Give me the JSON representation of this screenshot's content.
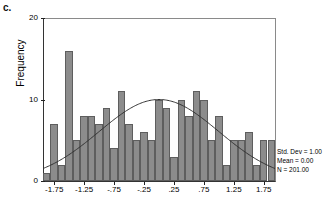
{
  "panel": {
    "label": "c."
  },
  "axes": {
    "y_label": "Frequency",
    "y_ticks": [
      "0",
      "10",
      "20"
    ],
    "x_ticks": [
      "-1.75",
      "-1.25",
      "-.75",
      "-.25",
      ".25",
      ".75",
      "1.25",
      "1.75"
    ]
  },
  "stats": {
    "std_dev": "Std. Dev = 1.00",
    "mean": "Mean = 0.00",
    "n": "N = 201.00"
  },
  "colors": {
    "bar_fill": "#8c8c8c",
    "bar_edge": "#5e5e5e",
    "curve": "#333333",
    "axis": "#222222",
    "frame": "#8a8a8a",
    "background": "#ffffff"
  },
  "chart_data": {
    "type": "bar",
    "title": "",
    "subtitle": "",
    "xlabel": "",
    "ylabel": "Frequency",
    "grid": false,
    "legend_position": "bottom-right",
    "xlim": [
      -1.9375,
      1.9375
    ],
    "ylim": [
      0,
      20
    ],
    "ytick_values": [
      0,
      10,
      20
    ],
    "xtick_values": [
      -1.75,
      -1.25,
      -0.75,
      -0.25,
      0.25,
      0.75,
      1.25,
      1.75
    ],
    "bin_width": 0.125,
    "bin_centers": [
      -1.875,
      -1.75,
      -1.625,
      -1.5,
      -1.375,
      -1.25,
      -1.125,
      -1.0,
      -0.875,
      -0.75,
      -0.625,
      -0.5,
      -0.375,
      -0.25,
      -0.125,
      0.0,
      0.125,
      0.25,
      0.375,
      0.5,
      0.625,
      0.75,
      0.875,
      1.0,
      1.125,
      1.25,
      1.375,
      1.5,
      1.625,
      1.75,
      1.875
    ],
    "categories": [
      "-1.875",
      "-1.75",
      "-1.625",
      "-1.5",
      "-1.375",
      "-1.25",
      "-1.125",
      "-1.0",
      "-0.875",
      "-0.75",
      "-0.625",
      "-0.5",
      "-0.375",
      "-0.25",
      "-0.125",
      "0.0",
      "0.125",
      "0.25",
      "0.375",
      "0.5",
      "0.625",
      "0.75",
      "0.875",
      "1.0",
      "1.125",
      "1.25",
      "1.375",
      "1.5",
      "1.625",
      "1.75",
      "1.875"
    ],
    "values": [
      1,
      7,
      2,
      16,
      5,
      8,
      8,
      7,
      9,
      4,
      11,
      7,
      5,
      6,
      5,
      10,
      9,
      3,
      10,
      8,
      11,
      10,
      5,
      8,
      2,
      5,
      5,
      6,
      2,
      5,
      5
    ],
    "overlay_curve": {
      "type": "normal",
      "mean": 0.0,
      "std_dev": 1.0,
      "n": 201,
      "peak_value": 10.0,
      "label": "normal curve"
    },
    "annotations": [
      "Std. Dev = 1.00",
      "Mean = 0.00",
      "N = 201.00"
    ]
  }
}
